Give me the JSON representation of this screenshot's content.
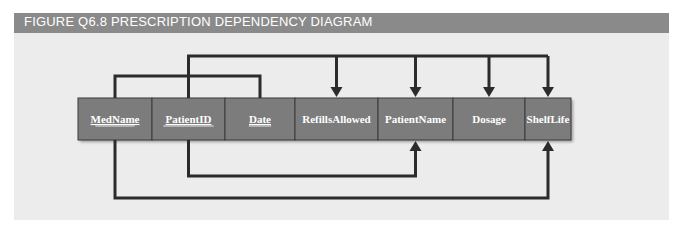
{
  "figure": {
    "title": "FIGURE Q6.8  PRESCRIPTION DEPENDENCY DIAGRAM"
  },
  "attributes": [
    {
      "name": "MedName",
      "key": true
    },
    {
      "name": "PatientID",
      "key": true
    },
    {
      "name": "Date",
      "key": true
    },
    {
      "name": "RefillsAllowed",
      "key": false
    },
    {
      "name": "PatientName",
      "key": false
    },
    {
      "name": "Dosage",
      "key": false
    },
    {
      "name": "ShelfLife",
      "key": false
    }
  ],
  "dependencies": [
    {
      "type": "full",
      "from": [
        "MedName",
        "PatientID",
        "Date"
      ],
      "to": [
        "RefillsAllowed",
        "PatientName",
        "Dosage",
        "ShelfLife"
      ]
    },
    {
      "type": "partial",
      "from": [
        "PatientID"
      ],
      "to": [
        "PatientName"
      ]
    },
    {
      "type": "partial",
      "from": [
        "MedName"
      ],
      "to": [
        "ShelfLife"
      ]
    }
  ],
  "colors": {
    "title_bar": "#8a8a8a",
    "panel": "#ececec",
    "cell_fill": "#7c7c7c",
    "line": "#2b2b2b"
  }
}
